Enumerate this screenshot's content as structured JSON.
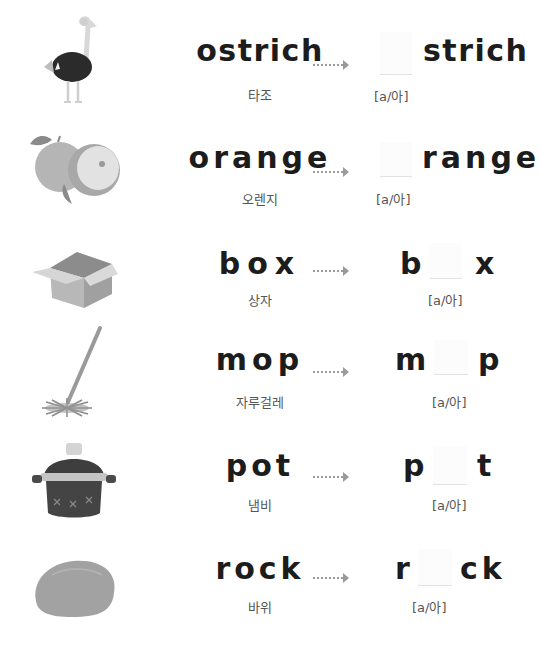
{
  "rows": [
    {
      "word": "ostrich",
      "korean": "타조",
      "image": "ostrich-illustration",
      "answer_before": "",
      "answer_after": "strich",
      "hint": "[a/아]"
    },
    {
      "word": "orange",
      "korean": "오렌지",
      "image": "orange-illustration",
      "answer_before": "",
      "answer_after": "range",
      "hint": "[a/아]"
    },
    {
      "word": "box",
      "korean": "상자",
      "image": "box-illustration",
      "answer_before": "b",
      "answer_after": "x",
      "hint": "[a/아]"
    },
    {
      "word": "mop",
      "korean": "자루걸레",
      "image": "mop-illustration",
      "answer_before": "m",
      "answer_after": "p",
      "hint": "[a/아]"
    },
    {
      "word": "pot",
      "korean": "냄비",
      "image": "pot-illustration",
      "answer_before": "p",
      "answer_after": "t",
      "hint": "[a/아]"
    },
    {
      "word": "rock",
      "korean": "바위",
      "image": "rock-illustration",
      "answer_before": "r",
      "answer_after": "ck",
      "hint": "[a/아]"
    }
  ],
  "icons": {
    "arrow": "dotted-right-arrow-icon"
  }
}
